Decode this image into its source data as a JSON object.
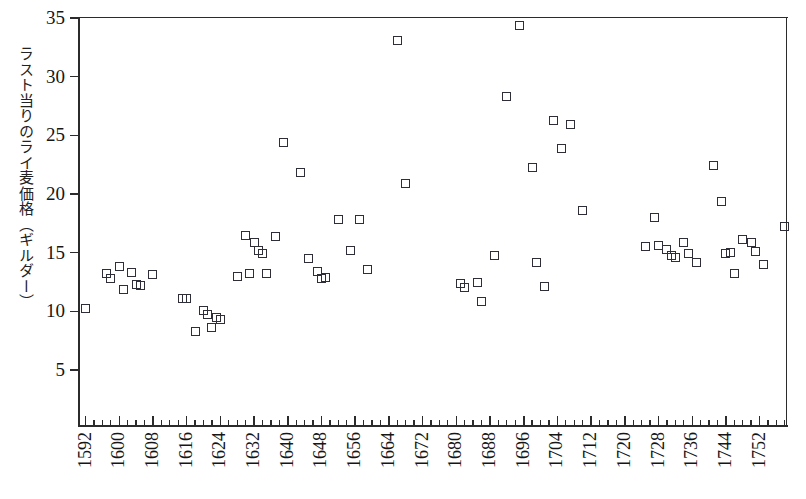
{
  "chart_data": {
    "type": "scatter",
    "title": "",
    "xlabel": "",
    "ylabel": "ラスト当りのライ麦価格（ギルダー）",
    "xlim": [
      1590,
      1758
    ],
    "ylim": [
      0,
      35
    ],
    "grid": false,
    "legend": "none",
    "marker": "open-square",
    "ytick_values": [
      5,
      10,
      15,
      20,
      25,
      30,
      35
    ],
    "ytick_labels": [
      "5",
      "10",
      "15",
      "20",
      "25",
      "30",
      "35"
    ],
    "xtick_labels": [
      "1592",
      "1600",
      "1608",
      "1616",
      "1624",
      "1632",
      "1640",
      "1648",
      "1656",
      "1664",
      "1672",
      "1680",
      "1688",
      "1696",
      "1704",
      "1712",
      "1720",
      "1728",
      "1736",
      "1744",
      "1752"
    ],
    "xtick_values": [
      1592,
      1600,
      1608,
      1616,
      1624,
      1632,
      1640,
      1648,
      1656,
      1664,
      1672,
      1680,
      1688,
      1696,
      1704,
      1712,
      1720,
      1728,
      1736,
      1744,
      1752
    ],
    "xtick_step_minor": 2,
    "points": [
      {
        "x": 1592,
        "y": 10.2
      },
      {
        "x": 1597,
        "y": 13.2
      },
      {
        "x": 1598,
        "y": 12.8
      },
      {
        "x": 1600,
        "y": 13.8
      },
      {
        "x": 1601,
        "y": 11.9
      },
      {
        "x": 1603,
        "y": 13.3
      },
      {
        "x": 1604,
        "y": 12.3
      },
      {
        "x": 1605,
        "y": 12.2
      },
      {
        "x": 1608,
        "y": 13.1
      },
      {
        "x": 1615,
        "y": 11.1
      },
      {
        "x": 1616,
        "y": 11.1
      },
      {
        "x": 1618,
        "y": 8.3
      },
      {
        "x": 1620,
        "y": 10.1
      },
      {
        "x": 1621,
        "y": 9.7
      },
      {
        "x": 1622,
        "y": 8.6
      },
      {
        "x": 1623,
        "y": 9.5
      },
      {
        "x": 1624,
        "y": 9.3
      },
      {
        "x": 1628,
        "y": 13.0
      },
      {
        "x": 1630,
        "y": 16.5
      },
      {
        "x": 1631,
        "y": 13.2
      },
      {
        "x": 1632,
        "y": 15.9
      },
      {
        "x": 1633,
        "y": 15.2
      },
      {
        "x": 1634,
        "y": 14.9
      },
      {
        "x": 1635,
        "y": 13.2
      },
      {
        "x": 1637,
        "y": 16.4
      },
      {
        "x": 1639,
        "y": 24.4
      },
      {
        "x": 1643,
        "y": 21.8
      },
      {
        "x": 1645,
        "y": 14.5
      },
      {
        "x": 1647,
        "y": 13.4
      },
      {
        "x": 1648,
        "y": 12.8
      },
      {
        "x": 1649,
        "y": 12.9
      },
      {
        "x": 1652,
        "y": 17.8
      },
      {
        "x": 1655,
        "y": 15.2
      },
      {
        "x": 1657,
        "y": 17.8
      },
      {
        "x": 1659,
        "y": 13.6
      },
      {
        "x": 1666,
        "y": 33.1
      },
      {
        "x": 1668,
        "y": 20.9
      },
      {
        "x": 1681,
        "y": 12.4
      },
      {
        "x": 1682,
        "y": 12.0
      },
      {
        "x": 1685,
        "y": 12.5
      },
      {
        "x": 1686,
        "y": 10.8
      },
      {
        "x": 1689,
        "y": 14.8
      },
      {
        "x": 1692,
        "y": 28.3
      },
      {
        "x": 1695,
        "y": 34.4
      },
      {
        "x": 1698,
        "y": 22.3
      },
      {
        "x": 1699,
        "y": 14.2
      },
      {
        "x": 1701,
        "y": 12.1
      },
      {
        "x": 1703,
        "y": 26.3
      },
      {
        "x": 1705,
        "y": 23.9
      },
      {
        "x": 1707,
        "y": 25.9
      },
      {
        "x": 1710,
        "y": 18.6
      },
      {
        "x": 1725,
        "y": 15.5
      },
      {
        "x": 1727,
        "y": 18.0
      },
      {
        "x": 1728,
        "y": 15.6
      },
      {
        "x": 1730,
        "y": 15.3
      },
      {
        "x": 1731,
        "y": 14.8
      },
      {
        "x": 1732,
        "y": 14.6
      },
      {
        "x": 1734,
        "y": 15.9
      },
      {
        "x": 1735,
        "y": 14.9
      },
      {
        "x": 1737,
        "y": 14.2
      },
      {
        "x": 1741,
        "y": 22.4
      },
      {
        "x": 1743,
        "y": 19.4
      },
      {
        "x": 1744,
        "y": 14.9
      },
      {
        "x": 1745,
        "y": 15.0
      },
      {
        "x": 1746,
        "y": 13.2
      },
      {
        "x": 1748,
        "y": 16.1
      },
      {
        "x": 1750,
        "y": 15.9
      },
      {
        "x": 1751,
        "y": 15.1
      },
      {
        "x": 1753,
        "y": 14.0
      },
      {
        "x": 1758,
        "y": 17.2
      }
    ]
  }
}
